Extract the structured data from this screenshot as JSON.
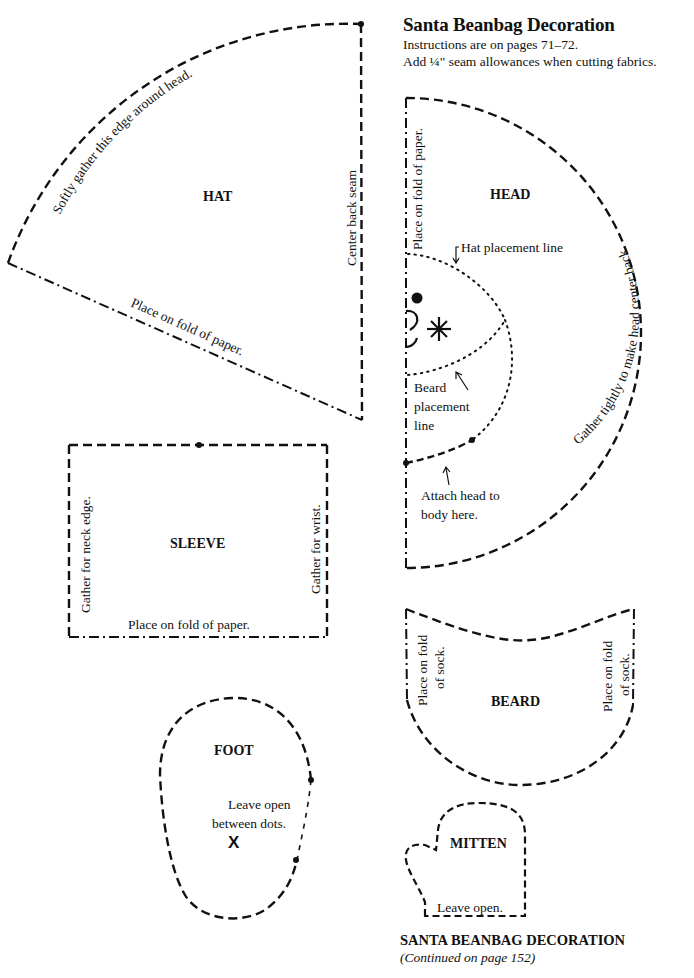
{
  "header": {
    "title": "Santa Beanbag Decoration",
    "instructions": "Instructions are on pages  71–72.",
    "seam_note": "Add ¼\" seam allowances when cutting fabrics."
  },
  "hat": {
    "label": "HAT",
    "curved_edge_note": "Softly gather this edge around head.",
    "right_edge_note": "Center back seam",
    "bottom_edge_note": "Place on fold of paper."
  },
  "head": {
    "label": "HEAD",
    "fold_note": "Place on fold of paper.",
    "curve_note": "Gather tightly to make head center back.",
    "hat_line_note": "Hat placement line",
    "beard_line_note": [
      "Beard",
      "placement",
      "line"
    ],
    "attach_note": [
      "Attach head to",
      "body here."
    ],
    "face_marks": [
      "eye-dot",
      "nose-arc",
      "mouth-arc",
      "cheek-asterisk"
    ]
  },
  "sleeve": {
    "label": "SLEEVE",
    "left_note": "Gather for neck edge.",
    "right_note": "Gather for wrist.",
    "bottom_note": "Place on fold of paper."
  },
  "beard": {
    "label": "BEARD",
    "left_note": [
      "Place on fold",
      "of sock."
    ],
    "right_note": [
      "Place on fold",
      "of sock."
    ]
  },
  "foot": {
    "label": "FOOT",
    "opening_note": [
      "Leave open",
      "between dots."
    ],
    "mark": "X"
  },
  "mitten": {
    "label": "MITTEN",
    "opening_note": "Leave open."
  },
  "footer": {
    "title": "SANTA BEANBAG DECORATION",
    "continued": "(Continued on page 152)"
  },
  "line_styles": {
    "cut_line": "dashed",
    "fold_line": "dash-dot",
    "placement_line": "dotted",
    "ink_color": "#111111",
    "paper_color": "#ffffff"
  }
}
